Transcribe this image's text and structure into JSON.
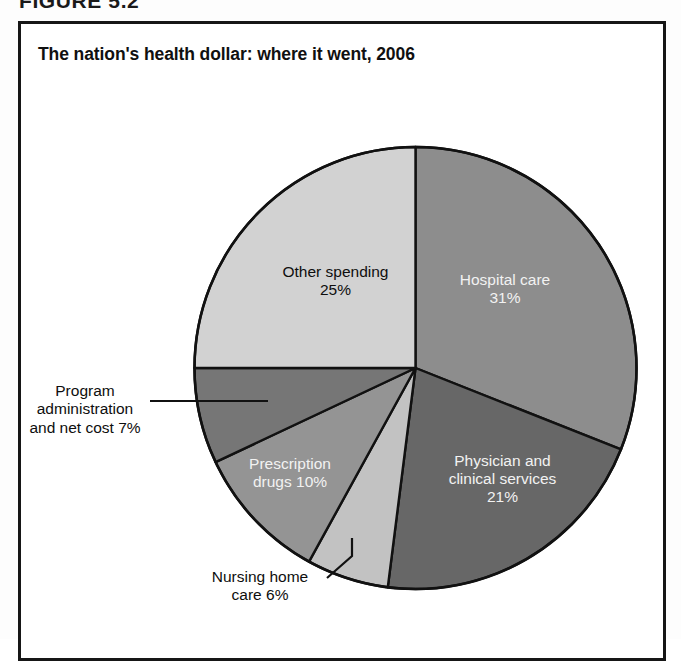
{
  "figure": {
    "number_label": "FIGURE 5.2",
    "title": "The nation's health dollar: where it went, 2006"
  },
  "colors": {
    "frame": "#161616",
    "background": "#ffffff",
    "outline": "#111111",
    "hospital_care": "#8d8d8d",
    "physician_clinical": "#676767",
    "nursing_home": "#c2c2c2",
    "prescription_drugs": "#949494",
    "program_administration": "#767676",
    "other_spending": "#d2d2d2",
    "label_light": "#f2f2f2",
    "label_dark": "#0e0e0e"
  },
  "labels": {
    "hospital_care_line1": "Hospital care",
    "hospital_care_line2": "31%",
    "physician_line1": "Physician and",
    "physician_line2": "clinical services",
    "physician_line3": "21%",
    "prescription_line1": "Prescription",
    "prescription_line2": "drugs 10%",
    "other_line1": "Other spending",
    "other_line2": "25%",
    "program_line1": "Program",
    "program_line2": "administration",
    "program_line3": "and net cost 7%",
    "nursing_line1": "Nursing home",
    "nursing_line2": "care 6%"
  },
  "chart_data": {
    "type": "pie",
    "title": "The nation's health dollar: where it went, 2006",
    "xlabel": "",
    "ylabel": "",
    "units": "percent",
    "total": 100,
    "start_angle_deg": 0,
    "direction": "clockwise",
    "legend_position": "none (labels on slices and callouts)",
    "categories": [
      "Hospital care",
      "Physician and clinical services",
      "Nursing home care",
      "Prescription drugs",
      "Program administration and net cost",
      "Other spending"
    ],
    "values": [
      31,
      21,
      6,
      10,
      7,
      25
    ],
    "slices": [
      {
        "label": "Hospital care",
        "value": 31,
        "display": "31%",
        "color": "#8d8d8d",
        "label_placement": "inside",
        "label_color": "light"
      },
      {
        "label": "Physician and clinical services",
        "value": 21,
        "display": "21%",
        "color": "#676767",
        "label_placement": "inside",
        "label_color": "light"
      },
      {
        "label": "Nursing home care",
        "value": 6,
        "display": "6%",
        "color": "#c2c2c2",
        "label_placement": "callout",
        "label_color": "dark"
      },
      {
        "label": "Prescription drugs",
        "value": 10,
        "display": "10%",
        "color": "#949494",
        "label_placement": "inside",
        "label_color": "light"
      },
      {
        "label": "Program administration and net cost",
        "value": 7,
        "display": "7%",
        "color": "#767676",
        "label_placement": "callout",
        "label_color": "dark"
      },
      {
        "label": "Other spending",
        "value": 25,
        "display": "25%",
        "color": "#d2d2d2",
        "label_placement": "inside",
        "label_color": "dark"
      }
    ]
  }
}
